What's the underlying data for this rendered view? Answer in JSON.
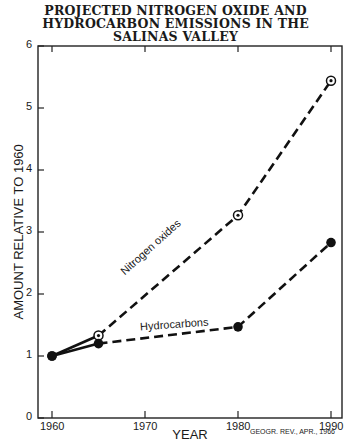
{
  "title_lines": [
    "PROJECTED NITROGEN OXIDE AND",
    "HYDROCARBON EMISSIONS IN THE",
    "SALINAS VALLEY"
  ],
  "source": "GEOGR. REV., APR., 1966",
  "chart_data": {
    "type": "line",
    "title": "Projected Nitrogen Oxide and Hydrocarbon Emissions in the Salinas Valley",
    "xlabel": "YEAR",
    "ylabel": "AMOUNT RELATIVE TO 1960",
    "xlim": [
      1956,
      1991
    ],
    "ylim": [
      0,
      6
    ],
    "x_ticks": [
      "1960",
      "1970",
      "1980",
      "1990"
    ],
    "y_ticks": [
      "0",
      "1",
      "2",
      "3",
      "4",
      "5",
      "6"
    ],
    "grid": false,
    "legend": "inline labels along lines",
    "series": [
      {
        "name": "Nitrogen oxides",
        "marker": "open-circle-with-dot",
        "style": "dashed",
        "x": [
          1960,
          1965,
          1980,
          1990
        ],
        "values": [
          1.0,
          1.33,
          3.27,
          5.44
        ]
      },
      {
        "name": "Hydrocarbons",
        "marker": "filled-circle",
        "style": "dashed",
        "x": [
          1960,
          1965,
          1980,
          1990
        ],
        "values": [
          1.0,
          1.2,
          1.47,
          2.83
        ]
      }
    ],
    "annotations": [
      "GEOGR. REV., APR., 1966"
    ]
  },
  "labels": {
    "nox": "Nitrogen oxides",
    "hc": "Hydrocarbons",
    "xlabel": "YEAR",
    "ylabel": "AMOUNT RELATIVE TO 1960"
  }
}
